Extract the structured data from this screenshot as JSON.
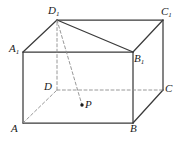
{
  "figure": {
    "type": "solid-geometry-diagram",
    "canvas": {
      "width": 185,
      "height": 141,
      "background": "#ffffff"
    },
    "colors": {
      "solid_edge": "#3a3a3a",
      "hidden_edge": "#8c8c8c",
      "construction_line": "#8c8c8c",
      "label_text": "#1a1a1a",
      "point_marker": "#1a1a1a"
    },
    "vertices": [
      {
        "id": "D1",
        "name": "D1",
        "letter": "D",
        "sub": "1",
        "x": 57,
        "y": 20,
        "label_x": 48,
        "label_y": 5,
        "hidden": false
      },
      {
        "id": "C1",
        "name": "C1",
        "letter": "C",
        "sub": "1",
        "x": 163,
        "y": 20,
        "label_x": 161,
        "label_y": 6,
        "hidden": false
      },
      {
        "id": "A1",
        "name": "A1",
        "letter": "A",
        "sub": "1",
        "x": 23,
        "y": 52,
        "label_x": 9,
        "label_y": 43,
        "hidden": false
      },
      {
        "id": "B1",
        "name": "B1",
        "letter": "B",
        "sub": "1",
        "x": 133,
        "y": 52,
        "label_x": 134,
        "label_y": 53,
        "hidden": false
      },
      {
        "id": "D",
        "name": "D",
        "letter": "D",
        "sub": "",
        "x": 57,
        "y": 90,
        "label_x": 44,
        "label_y": 81,
        "hidden": true
      },
      {
        "id": "C",
        "name": "C",
        "letter": "C",
        "sub": "",
        "x": 163,
        "y": 90,
        "label_x": 165,
        "label_y": 83,
        "hidden": false
      },
      {
        "id": "A",
        "name": "A",
        "letter": "A",
        "sub": "",
        "x": 23,
        "y": 123,
        "label_x": 11,
        "label_y": 123,
        "hidden": false
      },
      {
        "id": "B",
        "name": "B",
        "letter": "B",
        "sub": "",
        "x": 133,
        "y": 123,
        "label_x": 130,
        "label_y": 123,
        "hidden": false
      }
    ],
    "points": [
      {
        "id": "P",
        "name": "P",
        "letter": "P",
        "sub": "",
        "x": 82,
        "y": 105,
        "radius": 1.7,
        "label_x": 85,
        "label_y": 99
      }
    ],
    "edges": [
      {
        "from": "A1",
        "to": "B1",
        "style": "solid",
        "name": "edge-A1-B1"
      },
      {
        "from": "A1",
        "to": "D1",
        "style": "solid",
        "name": "edge-A1-D1"
      },
      {
        "from": "D1",
        "to": "C1",
        "style": "solid",
        "name": "edge-D1-C1"
      },
      {
        "from": "B1",
        "to": "C1",
        "style": "solid",
        "name": "edge-B1-C1"
      },
      {
        "from": "A",
        "to": "B",
        "style": "solid",
        "name": "edge-A-B"
      },
      {
        "from": "A",
        "to": "A1",
        "style": "solid",
        "name": "edge-A-A1"
      },
      {
        "from": "B",
        "to": "B1",
        "style": "solid",
        "name": "edge-B-B1"
      },
      {
        "from": "B",
        "to": "C",
        "style": "solid",
        "name": "edge-B-C"
      },
      {
        "from": "C",
        "to": "C1",
        "style": "solid",
        "name": "edge-C-C1"
      },
      {
        "from": "A",
        "to": "D",
        "style": "dashed",
        "name": "edge-A-D"
      },
      {
        "from": "D",
        "to": "C",
        "style": "dashed",
        "name": "edge-D-C"
      },
      {
        "from": "D",
        "to": "D1",
        "style": "dashed",
        "name": "edge-D-D1"
      }
    ],
    "construction_lines": [
      {
        "from": "D1",
        "to": "B1",
        "style": "solid",
        "name": "diagonal-D1-B1"
      },
      {
        "from": "D1",
        "to": "P",
        "style": "dashed",
        "name": "segment-D1-P"
      }
    ],
    "dash_pattern": "3,2.4",
    "stroke_widths": {
      "solid": 1.25,
      "hidden": 0.9,
      "construction": 0.9
    }
  }
}
